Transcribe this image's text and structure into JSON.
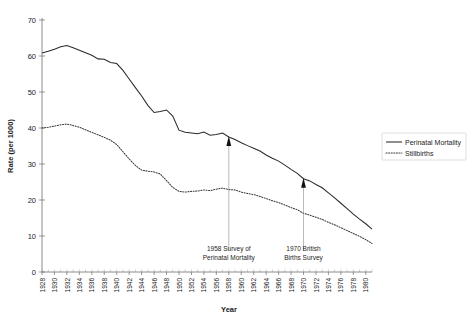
{
  "figure": {
    "partial_title": "",
    "background": "#ffffff"
  },
  "chart_data": {
    "type": "line",
    "title": "",
    "xlabel": "Year",
    "ylabel": "Rate (per 1000)",
    "xlim": [
      1928,
      1981
    ],
    "ylim": [
      0,
      70
    ],
    "yticks": [
      0,
      10,
      20,
      30,
      40,
      50,
      60,
      70
    ],
    "ytick_labels": [
      "0",
      "10",
      "20",
      "30",
      "40",
      "50",
      "60",
      "70"
    ],
    "xticks": [
      1928,
      1930,
      1932,
      1934,
      1936,
      1938,
      1940,
      1942,
      1944,
      1946,
      1948,
      1950,
      1952,
      1954,
      1956,
      1958,
      1960,
      1962,
      1964,
      1966,
      1968,
      1970,
      1972,
      1974,
      1976,
      1978,
      1980
    ],
    "xtick_labels": [
      "1928",
      "1930",
      "1932",
      "1934",
      "1936",
      "1938",
      "1940",
      "1942",
      "1944",
      "1946",
      "1948",
      "1950",
      "1952",
      "1954",
      "1956",
      "1958",
      "1960",
      "1962",
      "1964",
      "1966",
      "1968",
      "1970",
      "1972",
      "1974",
      "1976",
      "1978",
      "1980"
    ],
    "grid": false,
    "legend_position": "right",
    "x": [
      1928,
      1929,
      1930,
      1931,
      1932,
      1933,
      1934,
      1935,
      1936,
      1937,
      1938,
      1939,
      1940,
      1941,
      1942,
      1943,
      1944,
      1945,
      1946,
      1947,
      1948,
      1949,
      1950,
      1951,
      1952,
      1953,
      1954,
      1955,
      1956,
      1957,
      1958,
      1959,
      1960,
      1961,
      1962,
      1963,
      1964,
      1965,
      1966,
      1967,
      1968,
      1969,
      1970,
      1971,
      1972,
      1973,
      1974,
      1975,
      1976,
      1977,
      1978,
      1979,
      1980,
      1981
    ],
    "series": [
      {
        "name": "Perinatal Mortality",
        "style": "solid",
        "color": "#2a2a2a",
        "values": [
          60.8,
          61.3,
          61.9,
          62.6,
          62.9,
          62.3,
          61.6,
          60.9,
          60.2,
          59.2,
          59.1,
          58.2,
          57.9,
          56.0,
          53.6,
          51.2,
          48.9,
          46.3,
          44.3,
          44.6,
          45.0,
          43.3,
          39.4,
          38.8,
          38.6,
          38.4,
          38.9,
          38.0,
          38.2,
          38.6,
          37.5,
          36.8,
          35.9,
          35.1,
          34.4,
          33.6,
          32.5,
          31.6,
          30.8,
          29.7,
          28.5,
          27.4,
          25.9,
          25.3,
          24.3,
          23.4,
          22.0,
          20.6,
          19.1,
          17.6,
          16.1,
          14.7,
          13.4,
          11.9
        ]
      },
      {
        "name": "Stillbirths",
        "style": "dotted",
        "color": "#3a3a3a",
        "values": [
          40.0,
          40.2,
          40.5,
          40.9,
          41.1,
          40.7,
          40.2,
          39.5,
          38.8,
          38.1,
          37.4,
          36.6,
          35.4,
          33.4,
          31.4,
          29.6,
          28.3,
          28.0,
          27.8,
          27.2,
          25.4,
          23.5,
          22.4,
          22.2,
          22.4,
          22.5,
          22.8,
          22.6,
          23.0,
          23.3,
          22.9,
          22.8,
          22.2,
          21.8,
          21.5,
          21.0,
          20.4,
          19.8,
          19.3,
          18.6,
          17.9,
          17.3,
          16.3,
          15.8,
          15.2,
          14.6,
          13.8,
          13.1,
          12.3,
          11.5,
          10.7,
          9.9,
          9.0,
          7.9
        ]
      }
    ],
    "annotations": [
      {
        "name": "perinatal-mortality-survey",
        "lines": [
          "1958 Survey of",
          "Perinatal Mortality"
        ],
        "x_year": 1958,
        "target_value": 37.5
      },
      {
        "name": "british-births-survey",
        "lines": [
          "1970 British",
          "Births Survey"
        ],
        "x_year": 1970,
        "target_value": 25.9
      }
    ]
  },
  "legend": {
    "items": [
      {
        "label": "Perinatal Mortality",
        "style": "solid"
      },
      {
        "label": "Stillbirths",
        "style": "dotted"
      }
    ]
  }
}
